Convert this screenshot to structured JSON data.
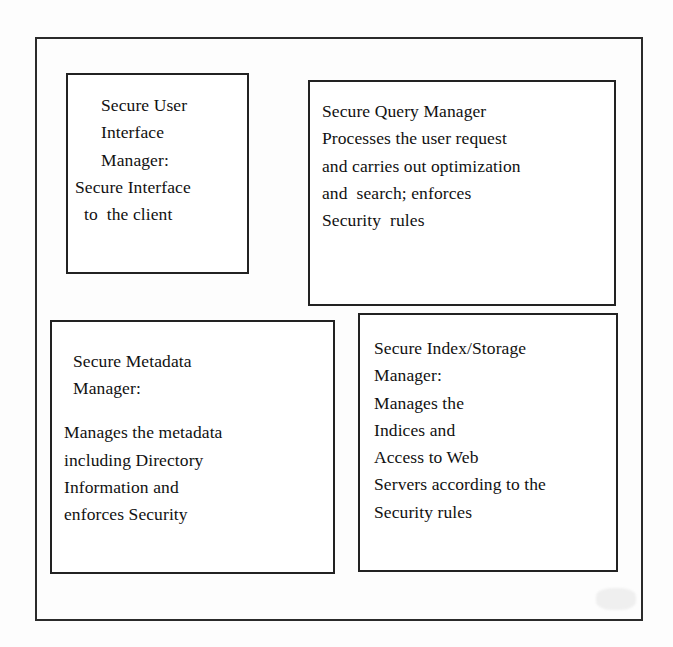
{
  "diagram": {
    "type": "block-architecture",
    "background_color": "#ffffff",
    "line_color": "#222222",
    "outer_frame": {
      "name": "secure-web-database-system-frame",
      "has_label": false
    },
    "boxes": [
      {
        "id": "secure-user-interface-manager",
        "title": "Secure User Interface Manager:",
        "position": "top-left",
        "lines": [
          {
            "text": "Secure User",
            "indent": "large"
          },
          {
            "text": "Interface",
            "indent": "large"
          },
          {
            "text": "Manager:",
            "indent": "large"
          },
          {
            "text": "Secure Interface",
            "indent": "none"
          },
          {
            "text": "to  the client",
            "indent": "small"
          }
        ]
      },
      {
        "id": "secure-query-manager",
        "title": "Secure Query Manager",
        "position": "top-right",
        "lines": [
          {
            "text": "Secure Query Manager",
            "indent": "none"
          },
          {
            "text": "Processes the user request",
            "indent": "none"
          },
          {
            "text": "and carries out optimization",
            "indent": "none"
          },
          {
            "text": "and  search; enforces",
            "indent": "none"
          },
          {
            "text": "Security  rules",
            "indent": "none"
          }
        ]
      },
      {
        "id": "secure-metadata-manager",
        "title": "Secure Metadata Manager:",
        "position": "bottom-left",
        "lines": [
          {
            "text": "Secure Metadata",
            "indent": "small"
          },
          {
            "text": "Manager:",
            "indent": "small"
          },
          {
            "text": "",
            "indent": "none",
            "blank": true
          },
          {
            "text": "Manages the metadata",
            "indent": "none"
          },
          {
            "text": "including Directory",
            "indent": "none"
          },
          {
            "text": "Information and",
            "indent": "none"
          },
          {
            "text": "enforces Security",
            "indent": "none"
          }
        ]
      },
      {
        "id": "secure-index-storage-manager",
        "title": "Secure Index/Storage Manager:",
        "position": "bottom-right",
        "lines": [
          {
            "text": "Secure Index/Storage",
            "indent": "none"
          },
          {
            "text": "Manager:",
            "indent": "none"
          },
          {
            "text": "Manages the",
            "indent": "none"
          },
          {
            "text": "Indices and",
            "indent": "none"
          },
          {
            "text": "Access to Web",
            "indent": "none"
          },
          {
            "text": "Servers according to the",
            "indent": "none"
          },
          {
            "text": "Security rules",
            "indent": "none"
          }
        ]
      }
    ]
  }
}
